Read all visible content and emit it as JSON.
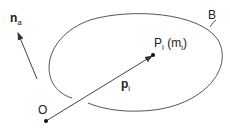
{
  "labels": {
    "na_main": "n",
    "na_sub": "a",
    "body": "B",
    "point_main": "P",
    "point_sub": "i",
    "mass_open": " (m",
    "mass_sub": "i",
    "mass_close": ")",
    "pos_main": "p",
    "pos_sub": "i",
    "origin": "O"
  },
  "colors": {
    "stroke": "#444444",
    "text": "#222222"
  }
}
